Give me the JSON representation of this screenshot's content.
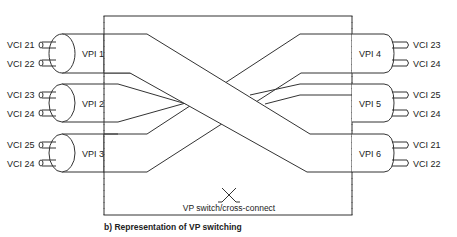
{
  "diagram": {
    "caption": "b)  Representation of VP switching",
    "switch_label": "VP switch/cross-connect",
    "switch_icon": "cross-connect-x-icon",
    "left_ports": [
      {
        "vpi": "VPI 1",
        "vcis": [
          "VCI 21",
          "VCI 22"
        ]
      },
      {
        "vpi": "VPI 2",
        "vcis": [
          "VCI 23",
          "VCI 24"
        ]
      },
      {
        "vpi": "VPI 3",
        "vcis": [
          "VCI 25",
          "VCI 24"
        ]
      }
    ],
    "right_ports": [
      {
        "vpi": "VPI 4",
        "vcis": [
          "VCI 23",
          "VCI 24"
        ]
      },
      {
        "vpi": "VPI 5",
        "vcis": [
          "VCI 25",
          "VCI 24"
        ]
      },
      {
        "vpi": "VPI 6",
        "vcis": [
          "VCI 21",
          "VCI 22"
        ]
      }
    ],
    "connections": [
      {
        "from": "VPI 1",
        "to": "VPI 6"
      },
      {
        "from": "VPI 2",
        "to": "VPI 5"
      },
      {
        "from": "VPI 3",
        "to": "VPI 4"
      }
    ]
  }
}
